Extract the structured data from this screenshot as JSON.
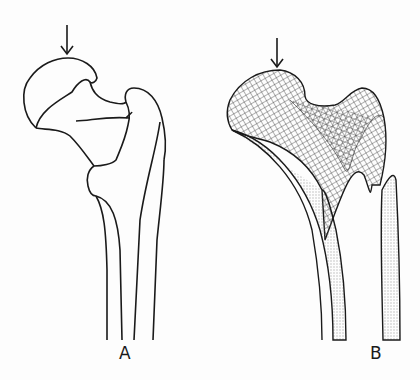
{
  "figure": {
    "panels": [
      {
        "id": "A",
        "label": "A",
        "description": "Outline drawing of proximal femur with arrow pointing to femoral head"
      },
      {
        "id": "B",
        "label": "B",
        "description": "Proximal femur showing trabecular stress lines (grid pattern) with arrow pointing to femoral head"
      }
    ],
    "colors": {
      "line": "#1a1a1a",
      "background": "#fdfdfd"
    }
  }
}
